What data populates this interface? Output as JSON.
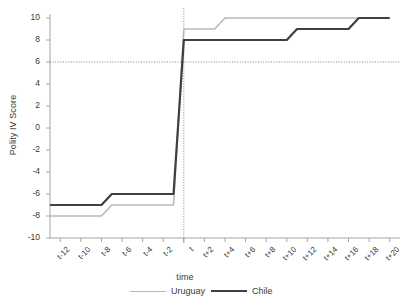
{
  "chart_data": {
    "type": "line",
    "title": "",
    "xlabel": "time",
    "ylabel": "Polity IV Score",
    "ylim": [
      -10,
      10
    ],
    "xlim": [
      -13,
      21
    ],
    "grid": false,
    "legend_position": "bottom",
    "y_ticks": [
      "10",
      "8",
      "6",
      "4",
      "2",
      "0",
      "-2",
      "-4",
      "-6",
      "-8",
      "-10"
    ],
    "y_tick_values": [
      10,
      8,
      6,
      4,
      2,
      0,
      -2,
      -4,
      -6,
      -8,
      -10
    ],
    "x_tick_labels": [
      "t-12",
      "t-10",
      "t-8",
      "t-6",
      "t-4",
      "t-2",
      "t",
      "t+2",
      "t+4",
      "t+6",
      "t+8",
      "t+10",
      "t+12",
      "t+14",
      "t+16",
      "t+18",
      "t+20"
    ],
    "x_tick_values": [
      -12,
      -10,
      -8,
      -6,
      -4,
      -2,
      0,
      2,
      4,
      6,
      8,
      10,
      12,
      14,
      16,
      18,
      20
    ],
    "annotations": [
      {
        "name": "democracy-threshold-line",
        "type": "hline",
        "y": 6,
        "style": "dotted"
      },
      {
        "name": "transition-year-line",
        "type": "vline",
        "x": 0,
        "style": "dotted"
      }
    ],
    "x": [
      -13,
      -12,
      -11,
      -10,
      -9,
      -8,
      -7,
      -6,
      -5,
      -4,
      -3,
      -2,
      -1,
      0,
      1,
      2,
      3,
      4,
      5,
      6,
      7,
      8,
      9,
      10,
      11,
      12,
      13,
      14,
      15,
      16,
      17,
      18,
      19,
      20
    ],
    "series": [
      {
        "name": "Uruguay",
        "color": "#b9b9b9",
        "width": 1.6,
        "values": [
          -8,
          -8,
          -8,
          -8,
          -8,
          -8,
          -7,
          -7,
          -7,
          -7,
          -7,
          -7,
          -7,
          9,
          9,
          9,
          9,
          10,
          10,
          10,
          10,
          10,
          10,
          10,
          10,
          10,
          10,
          10,
          10,
          10,
          10,
          10,
          10,
          10
        ]
      },
      {
        "name": "Chile",
        "color": "#3f3f3f",
        "width": 2.2,
        "values": [
          -7,
          -7,
          -7,
          -7,
          -7,
          -7,
          -6,
          -6,
          -6,
          -6,
          -6,
          -6,
          -6,
          8,
          8,
          8,
          8,
          8,
          8,
          8,
          8,
          8,
          8,
          8,
          9,
          9,
          9,
          9,
          9,
          9,
          10,
          10,
          10,
          10
        ]
      }
    ]
  },
  "legend": {
    "entries": [
      {
        "label": "Uruguay",
        "key": "uruguay"
      },
      {
        "label": "Chile",
        "key": "chile"
      }
    ]
  },
  "colors": {
    "uruguay": "#b9b9b9",
    "chile": "#3f3f3f",
    "axis": "#9a9a9a",
    "text": "#3a3a3a",
    "reference_line": "#777777"
  }
}
